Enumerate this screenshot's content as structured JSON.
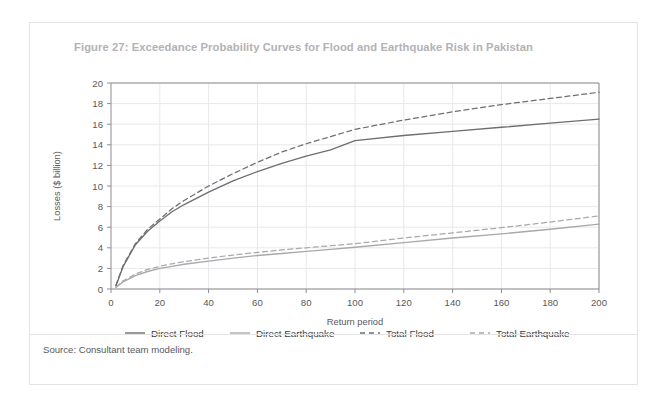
{
  "figure": {
    "title": "Figure 27: Exceedance Probability Curves for Flood and Earthquake Risk in Pakistan",
    "source": "Source: Consultant team modeling."
  },
  "colors": {
    "title": "#b2b2b5",
    "text": "#58595b",
    "grid": "#e8e8ea",
    "axis": "#8d8d90",
    "flood": "#6d6e71",
    "earthquake": "#a7a9ac",
    "card_border": "#e3e3e3"
  },
  "chart_data": {
    "type": "line",
    "title": "Figure 27: Exceedance Probability Curves for Flood and Earthquake Risk in Pakistan",
    "xlabel": "Return period",
    "ylabel": "Losses ($ billion)",
    "xlim": [
      0,
      200
    ],
    "ylim": [
      0,
      20
    ],
    "xticks": [
      0,
      20,
      40,
      60,
      80,
      100,
      120,
      140,
      160,
      180,
      200
    ],
    "yticks": [
      0,
      2,
      4,
      6,
      8,
      10,
      12,
      14,
      16,
      18,
      20
    ],
    "grid": true,
    "legend_position": "bottom",
    "x": [
      2,
      5,
      10,
      15,
      20,
      25,
      30,
      40,
      50,
      60,
      70,
      80,
      90,
      100,
      120,
      140,
      160,
      180,
      200
    ],
    "series": [
      {
        "name": "Direct Flood",
        "style": "solid",
        "color": "#6d6e71",
        "values": [
          0.3,
          2.2,
          4.3,
          5.6,
          6.6,
          7.5,
          8.2,
          9.4,
          10.5,
          11.4,
          12.2,
          12.9,
          13.5,
          14.4,
          14.9,
          15.3,
          15.7,
          16.1,
          16.5
        ]
      },
      {
        "name": "Direct Earthquake",
        "style": "solid",
        "color": "#a7a9ac",
        "values": [
          0.15,
          0.7,
          1.3,
          1.7,
          2.0,
          2.2,
          2.4,
          2.7,
          3.0,
          3.25,
          3.45,
          3.65,
          3.85,
          4.05,
          4.5,
          4.95,
          5.35,
          5.8,
          6.3
        ]
      },
      {
        "name": "Total Flood",
        "style": "dashed",
        "color": "#6d6e71",
        "values": [
          0.35,
          2.3,
          4.4,
          5.8,
          6.8,
          7.8,
          8.6,
          10.0,
          11.2,
          12.3,
          13.3,
          14.1,
          14.8,
          15.5,
          16.4,
          17.2,
          17.9,
          18.5,
          19.1
        ]
      },
      {
        "name": "Total Earthquake",
        "style": "dashed",
        "color": "#a7a9ac",
        "values": [
          0.18,
          0.8,
          1.45,
          1.9,
          2.2,
          2.45,
          2.65,
          3.0,
          3.3,
          3.55,
          3.8,
          4.0,
          4.2,
          4.4,
          4.95,
          5.45,
          5.95,
          6.5,
          7.1
        ]
      }
    ]
  },
  "legend": [
    {
      "label": "Direct Flood",
      "style": "solid",
      "color": "#6d6e71"
    },
    {
      "label": "Direct Earthquake",
      "style": "solid",
      "color": "#a7a9ac"
    },
    {
      "label": "Total Flood",
      "style": "dashed",
      "color": "#6d6e71"
    },
    {
      "label": "Total Earthquake",
      "style": "dashed",
      "color": "#a7a9ac"
    }
  ]
}
